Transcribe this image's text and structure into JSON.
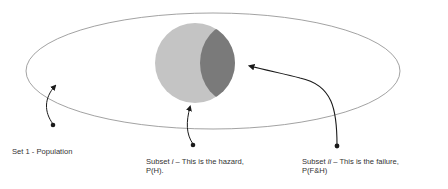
{
  "diagram": {
    "type": "venn-set-diagram",
    "colors": {
      "population_outline": "#8a8a8a",
      "hazard_fill": "#c4c4c4",
      "failure_fill": "#7a7a7a",
      "arrows": "#1a1a1a",
      "text": "#333333"
    },
    "sets": [
      {
        "id": "population",
        "label": "Set 1 - Population"
      },
      {
        "id": "hazard",
        "label_prefix": "Subset ",
        "label_italic": "i",
        "label_suffix": " – This is the hazard,",
        "label_line2": "P(H)."
      },
      {
        "id": "failure",
        "label_prefix": "Subset ",
        "label_italic": "ii",
        "label_suffix": " – This is the failure,",
        "label_line2": "P(F&H)"
      }
    ]
  }
}
